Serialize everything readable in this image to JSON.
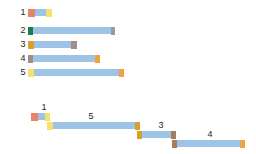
{
  "palette": {
    "bar_blue": "#9dc3e6",
    "red": "#e8836a",
    "yellow": "#f7e06e",
    "green": "#1f7a4d",
    "gray": "#9a9a98",
    "gold": "#d9a02b",
    "taupe": "#a08f84",
    "orange": "#f0a23c",
    "brown": "#a87a5e",
    "text": "#231f20",
    "background": "#ffffff"
  },
  "chart_data": {
    "type": "bar",
    "title": "",
    "xlabel": "",
    "ylabel": "",
    "grid": false,
    "legend": "none",
    "top_chart": {
      "type": "bar",
      "orientation": "horizontal",
      "categories": [
        "1",
        "2",
        "3",
        "4",
        "5"
      ],
      "values": [
        24,
        87,
        49,
        72,
        96
      ],
      "bars": [
        {
          "label": "1",
          "label_x": 18,
          "y": 9,
          "start": 28,
          "end": 52,
          "length": 24,
          "start_cap_color": "#e8836a",
          "start_cap_width": 7,
          "end_cap_color": "#f7e06e",
          "end_cap_width": 6,
          "body_color": "#9dc3e6"
        },
        {
          "label": "2",
          "label_x": 18,
          "y": 27,
          "start": 28,
          "end": 115,
          "length": 87,
          "start_cap_color": "#1f7a4d",
          "start_cap_width": 5,
          "end_cap_color": "#9a9a98",
          "end_cap_width": 4,
          "body_color": "#9dc3e6"
        },
        {
          "label": "3",
          "label_x": 18,
          "y": 41,
          "start": 28,
          "end": 77,
          "length": 49,
          "start_cap_color": "#d9a02b",
          "start_cap_width": 6,
          "end_cap_color": "#a08f84",
          "end_cap_width": 6,
          "body_color": "#9dc3e6"
        },
        {
          "label": "4",
          "label_x": 18,
          "y": 55,
          "start": 28,
          "end": 100,
          "length": 72,
          "start_cap_color": "#a08f84",
          "start_cap_width": 5,
          "end_cap_color": "#f0a23c",
          "end_cap_width": 5,
          "body_color": "#9dc3e6"
        },
        {
          "label": "5",
          "label_x": 18,
          "y": 69,
          "start": 28,
          "end": 124,
          "length": 96,
          "start_cap_color": "#f7e06e",
          "start_cap_width": 6,
          "end_cap_color": "#f0a23c",
          "end_cap_width": 5,
          "body_color": "#9dc3e6"
        }
      ]
    },
    "bottom_chart": {
      "type": "bar",
      "orientation": "horizontal",
      "style": "cascade",
      "categories": [
        "1",
        "5",
        "3",
        "4"
      ],
      "values": [
        19,
        93,
        39,
        73
      ],
      "bars": [
        {
          "label": "1",
          "label_x": 38,
          "label_y": 103,
          "y": 113,
          "start": 31,
          "end": 50,
          "length": 19,
          "start_cap_color": "#e8836a",
          "start_cap_width": 7,
          "end_cap_color": "#f7e06e",
          "end_cap_width": 5,
          "body_color": "#9dc3e6"
        },
        {
          "label": "5",
          "label_x": 85,
          "label_y": 112,
          "y": 122,
          "start": 47,
          "end": 140,
          "length": 93,
          "start_cap_color": "#f7e06e",
          "start_cap_width": 6,
          "end_cap_color": "#d9a02b",
          "end_cap_width": 5,
          "body_color": "#9dc3e6"
        },
        {
          "label": "3",
          "label_x": 155,
          "label_y": 121,
          "y": 131,
          "start": 137,
          "end": 176,
          "length": 39,
          "start_cap_color": "#d9a02b",
          "start_cap_width": 5,
          "end_cap_color": "#a87a5e",
          "end_cap_width": 5,
          "body_color": "#9dc3e6"
        },
        {
          "label": "4",
          "label_x": 204,
          "label_y": 130,
          "y": 140,
          "start": 172,
          "end": 245,
          "length": 73,
          "start_cap_color": "#a87a5e",
          "start_cap_width": 5,
          "end_cap_color": "#f0a23c",
          "end_cap_width": 5,
          "body_color": "#9dc3e6"
        }
      ]
    }
  }
}
